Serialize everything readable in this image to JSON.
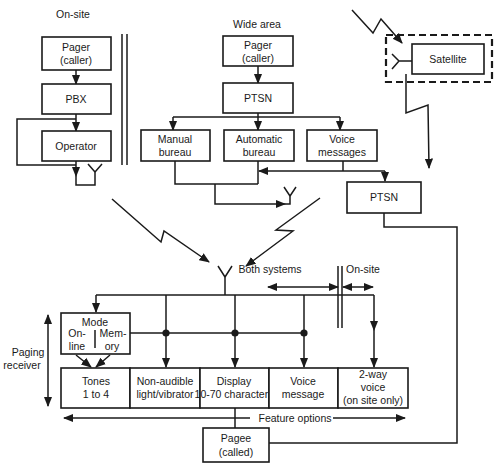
{
  "diagram": {
    "colors": {
      "ink": "#1a1a1a",
      "background": "#ffffff"
    },
    "on_site": {
      "heading": "On-site",
      "pager_line1": "Pager",
      "pager_line2": "(caller)",
      "pbx": "PBX",
      "operator": "Operator"
    },
    "wide_area": {
      "heading": "Wide area",
      "pager_line1": "Pager",
      "pager_line2": "(caller)",
      "ptsn": "PTSN",
      "manual_line1": "Manual",
      "manual_line2": "bureau",
      "automatic_line1": "Automatic",
      "automatic_line2": "bureau",
      "voice_line1": "Voice",
      "voice_line2": "messages",
      "ptsn2": "PTSN"
    },
    "satellite": {
      "label": "Satellite"
    },
    "receiver": {
      "side_label_line1": "Paging",
      "side_label_line2": "receiver",
      "both_systems": "Both systems",
      "on_site": "On-site",
      "mode": "Mode",
      "online_line1": "On-",
      "online_line2": "line",
      "memory_line1": "Mem-",
      "memory_line2": "ory",
      "features": [
        {
          "line1": "Tones",
          "line2": "1 to 4",
          "line3": ""
        },
        {
          "line1": "Non-audible",
          "line2": "light/vibrator",
          "line3": ""
        },
        {
          "line1": "Display",
          "line2": "10-70 characters",
          "line3": ""
        },
        {
          "line1": "Voice",
          "line2": "message",
          "line3": ""
        },
        {
          "line1": "2-way",
          "line2": "voice",
          "line3": "(on site only)"
        }
      ],
      "feature_options": "Feature options",
      "pagee_line1": "Pagee",
      "pagee_line2": "(called)"
    }
  }
}
